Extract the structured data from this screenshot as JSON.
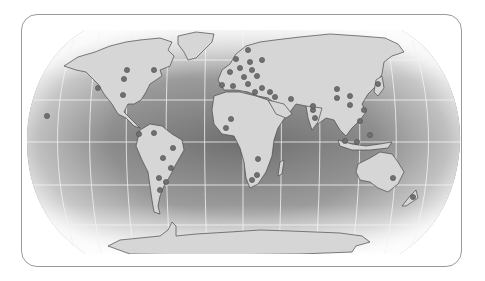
{
  "map": {
    "projection": "robinson",
    "style": "grayscale",
    "colors": {
      "frame_border": "#9a9a9a",
      "ocean_center": "#7d7d7d",
      "ocean_edge_light": "#f2f2f2",
      "land": "#d4d4d4",
      "coast": "#4a4a4a",
      "graticule": "#f4f4f4",
      "marker_fill": "#707070",
      "marker_stroke": "#505050"
    },
    "graticule": {
      "parallels_y": [
        60,
        100,
        142,
        185,
        232
      ],
      "meridian_count": 12
    },
    "markers": [
      {
        "region": "pacific-hawaii",
        "x": 47,
        "y": 116
      },
      {
        "region": "north-america",
        "x": 98,
        "y": 88
      },
      {
        "region": "north-america",
        "x": 124,
        "y": 79
      },
      {
        "region": "north-america",
        "x": 127,
        "y": 70
      },
      {
        "region": "north-america",
        "x": 154,
        "y": 70
      },
      {
        "region": "north-america",
        "x": 123,
        "y": 95
      },
      {
        "region": "south-america",
        "x": 139,
        "y": 134
      },
      {
        "region": "south-america",
        "x": 154,
        "y": 133
      },
      {
        "region": "south-america",
        "x": 173,
        "y": 148
      },
      {
        "region": "south-america",
        "x": 163,
        "y": 158
      },
      {
        "region": "south-america",
        "x": 171,
        "y": 168
      },
      {
        "region": "south-america",
        "x": 159,
        "y": 178
      },
      {
        "region": "south-america",
        "x": 166,
        "y": 182
      },
      {
        "region": "south-america",
        "x": 160,
        "y": 190
      },
      {
        "region": "europe",
        "x": 236,
        "y": 59
      },
      {
        "region": "europe",
        "x": 248,
        "y": 50
      },
      {
        "region": "europe",
        "x": 262,
        "y": 60
      },
      {
        "region": "europe",
        "x": 250,
        "y": 62
      },
      {
        "region": "europe",
        "x": 240,
        "y": 68
      },
      {
        "region": "europe",
        "x": 252,
        "y": 70
      },
      {
        "region": "europe",
        "x": 230,
        "y": 72
      },
      {
        "region": "europe",
        "x": 244,
        "y": 77
      },
      {
        "region": "europe",
        "x": 257,
        "y": 76
      },
      {
        "region": "europe",
        "x": 248,
        "y": 84
      },
      {
        "region": "europe",
        "x": 262,
        "y": 88
      },
      {
        "region": "europe",
        "x": 270,
        "y": 92
      },
      {
        "region": "europe",
        "x": 222,
        "y": 85
      },
      {
        "region": "europe",
        "x": 233,
        "y": 86
      },
      {
        "region": "europe",
        "x": 255,
        "y": 92
      },
      {
        "region": "middle-east",
        "x": 275,
        "y": 97
      },
      {
        "region": "middle-east",
        "x": 291,
        "y": 99
      },
      {
        "region": "middle-east",
        "x": 313,
        "y": 110
      },
      {
        "region": "africa",
        "x": 231,
        "y": 119
      },
      {
        "region": "africa",
        "x": 226,
        "y": 128
      },
      {
        "region": "africa",
        "x": 258,
        "y": 159
      },
      {
        "region": "africa",
        "x": 257,
        "y": 175
      },
      {
        "region": "africa",
        "x": 252,
        "y": 180
      },
      {
        "region": "asia",
        "x": 337,
        "y": 89
      },
      {
        "region": "asia",
        "x": 337,
        "y": 98
      },
      {
        "region": "asia",
        "x": 350,
        "y": 96
      },
      {
        "region": "asia",
        "x": 350,
        "y": 105
      },
      {
        "region": "asia",
        "x": 313,
        "y": 106
      },
      {
        "region": "asia",
        "x": 315,
        "y": 118
      },
      {
        "region": "asia",
        "x": 364,
        "y": 110
      },
      {
        "region": "asia-japan",
        "x": 378,
        "y": 84
      },
      {
        "region": "asia",
        "x": 360,
        "y": 121
      },
      {
        "region": "southeast-asia",
        "x": 345,
        "y": 141
      },
      {
        "region": "southeast-asia",
        "x": 370,
        "y": 135
      },
      {
        "region": "southeast-asia",
        "x": 357,
        "y": 142
      },
      {
        "region": "oceania-australia",
        "x": 393,
        "y": 178
      },
      {
        "region": "oceania-new-zealand",
        "x": 413,
        "y": 197
      }
    ]
  }
}
